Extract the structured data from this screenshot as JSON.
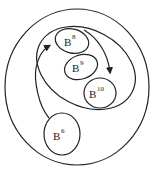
{
  "diagram": {
    "sets": [
      {
        "id": "outer",
        "label": ""
      },
      {
        "id": "inner",
        "label": ""
      },
      {
        "id": "b8",
        "base": "B",
        "exponent": "8"
      },
      {
        "id": "b9",
        "base": "B",
        "exponent": "9"
      },
      {
        "id": "b10",
        "base": "B",
        "exponent": "10"
      },
      {
        "id": "b6",
        "base": "B",
        "exponent": "6"
      }
    ],
    "arrows": [
      {
        "from": "b6",
        "to": "b8"
      },
      {
        "from": "b8",
        "to": "b10"
      }
    ],
    "colors": {
      "stroke": "#222222",
      "background": "#ffffff"
    }
  }
}
